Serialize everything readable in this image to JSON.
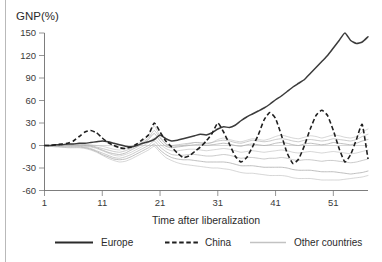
{
  "chart_data": {
    "type": "line",
    "title": "",
    "xlabel": "Time after liberalization",
    "ylabel": "GNP(%)",
    "xlim": [
      1,
      57
    ],
    "ylim": [
      -60,
      150
    ],
    "xticks": [
      1,
      11,
      21,
      31,
      41,
      51
    ],
    "yticks": [
      -60,
      -30,
      0,
      30,
      60,
      90,
      120,
      150
    ],
    "grid": false,
    "legend_position": "bottom",
    "zero_reference_line": true,
    "x": [
      1,
      2,
      3,
      4,
      5,
      6,
      7,
      8,
      9,
      10,
      11,
      12,
      13,
      14,
      15,
      16,
      17,
      18,
      19,
      20,
      21,
      22,
      23,
      24,
      25,
      26,
      27,
      28,
      29,
      30,
      31,
      32,
      33,
      34,
      35,
      36,
      37,
      38,
      39,
      40,
      41,
      42,
      43,
      44,
      45,
      46,
      47,
      48,
      49,
      50,
      51,
      52,
      53,
      54,
      55,
      56,
      57
    ],
    "series": [
      {
        "name": "Europe",
        "style": "solid",
        "color": "#3b3b3b",
        "values": [
          0,
          0,
          1,
          1,
          2,
          2,
          3,
          3,
          4,
          5,
          6,
          5,
          3,
          1,
          -1,
          -2,
          0,
          3,
          5,
          8,
          14,
          9,
          6,
          7,
          9,
          11,
          13,
          15,
          14,
          17,
          22,
          25,
          24,
          27,
          33,
          38,
          42,
          46,
          50,
          55,
          61,
          66,
          72,
          78,
          83,
          88,
          96,
          104,
          112,
          120,
          130,
          140,
          150,
          140,
          136,
          138,
          145
        ]
      },
      {
        "name": "China",
        "style": "dashed",
        "color": "#1f1f1f",
        "values": [
          0,
          0,
          1,
          2,
          3,
          6,
          12,
          18,
          20,
          17,
          10,
          4,
          0,
          -3,
          -4,
          -2,
          2,
          8,
          14,
          30,
          18,
          6,
          -2,
          -10,
          -16,
          -14,
          -8,
          -2,
          6,
          16,
          30,
          18,
          2,
          -14,
          -22,
          -16,
          -2,
          14,
          34,
          44,
          36,
          14,
          -10,
          -24,
          -18,
          0,
          22,
          40,
          47,
          40,
          20,
          -4,
          -22,
          -12,
          8,
          28,
          -18
        ]
      },
      {
        "name": "Other countries",
        "style": "solid",
        "color": "#b0b0b0",
        "is_band": true,
        "members": [
          {
            "values": [
              0,
              0,
              1,
              1,
              2,
              2,
              3,
              2,
              1,
              0,
              -1,
              -3,
              -5,
              -6,
              -4,
              -1,
              2,
              6,
              14,
              26,
              12,
              2,
              -2,
              -1,
              0,
              2,
              4,
              3,
              2,
              4,
              8,
              10,
              8,
              6,
              5,
              7,
              9,
              8,
              7,
              9,
              12,
              14,
              12,
              10,
              9,
              11,
              13,
              12,
              10,
              12,
              14,
              13,
              11,
              10,
              12,
              18,
              22
            ]
          },
          {
            "values": [
              0,
              0,
              0,
              1,
              1,
              1,
              2,
              1,
              0,
              -2,
              -4,
              -6,
              -8,
              -9,
              -7,
              -4,
              0,
              4,
              10,
              20,
              10,
              2,
              0,
              1,
              2,
              3,
              4,
              4,
              3,
              4,
              6,
              7,
              6,
              4,
              3,
              5,
              7,
              6,
              5,
              6,
              8,
              9,
              8,
              6,
              5,
              7,
              8,
              7,
              6,
              7,
              9,
              8,
              7,
              6,
              8,
              12,
              15
            ]
          },
          {
            "values": [
              0,
              0,
              0,
              0,
              1,
              1,
              1,
              0,
              -1,
              -3,
              -6,
              -9,
              -11,
              -12,
              -10,
              -6,
              -2,
              2,
              8,
              16,
              6,
              -1,
              -3,
              -2,
              -1,
              0,
              1,
              1,
              0,
              1,
              2,
              3,
              2,
              0,
              -1,
              1,
              2,
              1,
              0,
              1,
              3,
              4,
              3,
              1,
              0,
              2,
              3,
              2,
              1,
              2,
              4,
              3,
              2,
              1,
              3,
              6,
              8
            ]
          },
          {
            "values": [
              0,
              0,
              0,
              0,
              0,
              0,
              0,
              -1,
              -2,
              -4,
              -7,
              -10,
              -13,
              -14,
              -12,
              -9,
              -5,
              -1,
              4,
              10,
              2,
              -4,
              -7,
              -7,
              -6,
              -5,
              -5,
              -6,
              -7,
              -6,
              -5,
              -4,
              -5,
              -7,
              -9,
              -8,
              -7,
              -8,
              -9,
              -8,
              -7,
              -6,
              -7,
              -9,
              -10,
              -9,
              -8,
              -9,
              -10,
              -9,
              -8,
              -9,
              -10,
              -11,
              -10,
              -8,
              -6
            ]
          },
          {
            "values": [
              0,
              0,
              -1,
              -1,
              -1,
              -1,
              -1,
              -2,
              -4,
              -7,
              -10,
              -13,
              -16,
              -17,
              -15,
              -12,
              -8,
              -4,
              0,
              6,
              -2,
              -8,
              -12,
              -13,
              -13,
              -12,
              -12,
              -13,
              -14,
              -14,
              -13,
              -12,
              -13,
              -15,
              -17,
              -16,
              -16,
              -17,
              -18,
              -17,
              -17,
              -16,
              -17,
              -19,
              -20,
              -19,
              -19,
              -20,
              -21,
              -20,
              -20,
              -21,
              -22,
              -23,
              -22,
              -20,
              -18
            ]
          },
          {
            "values": [
              0,
              -1,
              -1,
              -2,
              -2,
              -2,
              -2,
              -3,
              -5,
              -8,
              -12,
              -15,
              -18,
              -19,
              -18,
              -15,
              -11,
              -7,
              -3,
              2,
              -6,
              -12,
              -16,
              -18,
              -19,
              -19,
              -20,
              -21,
              -22,
              -22,
              -22,
              -22,
              -23,
              -25,
              -27,
              -27,
              -27,
              -28,
              -29,
              -29,
              -29,
              -29,
              -30,
              -32,
              -33,
              -33,
              -33,
              -34,
              -35,
              -35,
              -35,
              -36,
              -37,
              -38,
              -37,
              -36,
              -34
            ]
          },
          {
            "values": [
              0,
              -1,
              -2,
              -2,
              -3,
              -3,
              -3,
              -4,
              -6,
              -9,
              -13,
              -17,
              -20,
              -22,
              -21,
              -18,
              -14,
              -10,
              -6,
              -1,
              -9,
              -16,
              -20,
              -23,
              -25,
              -26,
              -27,
              -28,
              -29,
              -30,
              -30,
              -31,
              -32,
              -34,
              -36,
              -37,
              -37,
              -38,
              -39,
              -40,
              -40,
              -40,
              -41,
              -43,
              -44,
              -44,
              -44,
              -45,
              -46,
              -46,
              -46,
              -46,
              -45,
              -44,
              -43,
              -42,
              -40
            ]
          }
        ]
      }
    ],
    "legend": [
      {
        "label": "Europe",
        "style": "solid",
        "color": "#2b2b2b"
      },
      {
        "label": "China",
        "style": "dashed",
        "color": "#1f1f1f"
      },
      {
        "label": "Other countries",
        "style": "solid",
        "color": "#c2c2c2"
      }
    ]
  }
}
